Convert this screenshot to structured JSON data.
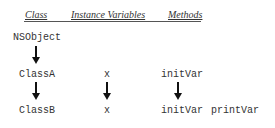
{
  "header": {
    "columns": [
      "Class",
      "Instance Variables",
      "Methods"
    ]
  },
  "rows": [
    {
      "class": "NSObject",
      "variables": "",
      "methods": []
    },
    {
      "class": "ClassA",
      "variables": "x",
      "methods": [
        "initVar"
      ]
    },
    {
      "class": "ClassB",
      "variables": "x",
      "methods": [
        "initVar",
        "printVar"
      ]
    }
  ],
  "colors": {
    "text": "#333333",
    "arrow": "#111111"
  }
}
